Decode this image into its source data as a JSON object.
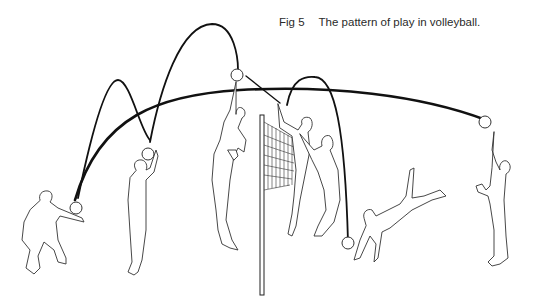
{
  "caption": {
    "figure_number": "Fig 5",
    "title": "The pattern of play in volleyball."
  },
  "illustration": {
    "subject": "volleyball play sequence",
    "players": [
      {
        "id": "receiver",
        "action": "forearm pass (dig)"
      },
      {
        "id": "setter",
        "action": "set"
      },
      {
        "id": "spiker",
        "action": "spike"
      },
      {
        "id": "blocker-1",
        "action": "block"
      },
      {
        "id": "blocker-2",
        "action": "block"
      },
      {
        "id": "diver",
        "action": "dive"
      },
      {
        "id": "server",
        "action": "serve"
      }
    ],
    "net": "volleyball net with post",
    "colors": {
      "line": "#111111",
      "background": "#ffffff"
    }
  }
}
